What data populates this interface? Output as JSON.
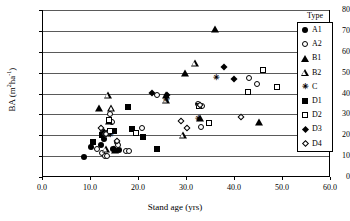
{
  "chart_data": {
    "type": "scatter",
    "title": "",
    "xlabel": "Stand age (yrs)",
    "ylabel_text": "BA (m",
    "ylabel_sup1": "2",
    "ylabel_mid": "ha",
    "ylabel_sup2": "-1",
    "ylabel_end": ")",
    "ylabel": "BA (m2ha-1)",
    "xlim": [
      0,
      60
    ],
    "ylim": [
      0,
      80
    ],
    "xticks": [
      "0.0",
      "10.0",
      "20.0",
      "30.0",
      "40.0",
      "50.0",
      "60.0"
    ],
    "xtick_values": [
      0,
      10,
      20,
      30,
      40,
      50,
      60
    ],
    "yticks": [
      "0",
      "10",
      "20",
      "30",
      "40",
      "50",
      "60",
      "70",
      "80"
    ],
    "ytick_values": [
      0,
      10,
      20,
      30,
      40,
      50,
      60,
      70,
      80
    ],
    "grid": "horizontal",
    "legend_position": "right-inside",
    "legend_title": "Type",
    "series": [
      {
        "name": "A1",
        "marker": "filled-circle",
        "points": [
          [
            8.7,
            9.8
          ],
          [
            10.3,
            14.2
          ],
          [
            12.2,
            15.4
          ],
          [
            13.0,
            18.4
          ],
          [
            13.5,
            21.2
          ],
          [
            14.3,
            22.0
          ],
          [
            14.8,
            13.6
          ],
          [
            15.6,
            16.6
          ],
          [
            16.0,
            13.1
          ]
        ]
      },
      {
        "name": "A2",
        "marker": "open-circle",
        "points": [
          [
            11.5,
            13.2
          ],
          [
            12.4,
            11.4
          ],
          [
            13.2,
            10.2
          ],
          [
            13.6,
            10.2
          ],
          [
            14.2,
            30.1
          ],
          [
            14.6,
            26.4
          ],
          [
            15.8,
            15.1
          ],
          [
            17.4,
            12.5
          ],
          [
            18.2,
            12.6
          ],
          [
            20.8,
            23.3
          ],
          [
            23.9,
            39.3
          ],
          [
            32.6,
            35.0
          ],
          [
            33.4,
            33.9
          ],
          [
            33.2,
            24.0
          ],
          [
            43.2,
            47.3
          ],
          [
            44.8,
            44.5
          ]
        ]
      },
      {
        "name": "B1",
        "marker": "filled-triangle",
        "points": [
          [
            11.9,
            32.9
          ],
          [
            13.6,
            21.2
          ],
          [
            14.0,
            26.9
          ],
          [
            15.3,
            13.1
          ],
          [
            25.9,
            39.3
          ],
          [
            29.7,
            49.6
          ],
          [
            33.0,
            28.4
          ],
          [
            36.1,
            70.7
          ],
          [
            45.2,
            26.2
          ]
        ]
      },
      {
        "name": "B2",
        "marker": "open-triangle",
        "points": [
          [
            13.3,
            13.4
          ],
          [
            13.7,
            39.2
          ],
          [
            14.4,
            33.0
          ],
          [
            25.8,
            37.1
          ],
          [
            29.3,
            20.1
          ],
          [
            31.8,
            54.8
          ]
        ]
      },
      {
        "name": "C",
        "marker": "asterisk",
        "points": [
          [
            14.2,
            20.8
          ],
          [
            25.9,
            37.3
          ],
          [
            32.5,
            28.5
          ],
          [
            36.3,
            48.1
          ]
        ]
      },
      {
        "name": "D1",
        "marker": "filled-square",
        "points": [
          [
            10.6,
            17.0
          ],
          [
            12.6,
            20.1
          ],
          [
            14.4,
            21.8
          ],
          [
            14.9,
            22.0
          ],
          [
            17.9,
            33.3
          ],
          [
            18.8,
            22.9
          ],
          [
            21.0,
            19.3
          ],
          [
            23.9,
            13.2
          ]
        ]
      },
      {
        "name": "D2",
        "marker": "open-square",
        "points": [
          [
            14.0,
            27.4
          ],
          [
            14.2,
            22.1
          ],
          [
            19.6,
            20.9
          ],
          [
            32.8,
            34.0
          ],
          [
            34.8,
            26.0
          ],
          [
            42.9,
            40.5
          ],
          [
            46.0,
            51.2
          ],
          [
            48.9,
            43.3
          ]
        ]
      },
      {
        "name": "D3",
        "marker": "filled-diamond",
        "points": [
          [
            12.7,
            21.9
          ],
          [
            15.1,
            13.4
          ],
          [
            22.9,
            40.3
          ],
          [
            26.0,
            39.5
          ],
          [
            37.9,
            52.5
          ],
          [
            40.0,
            46.9
          ]
        ]
      },
      {
        "name": "D4",
        "marker": "open-diamond",
        "points": [
          [
            12.2,
            23.5
          ],
          [
            13.3,
            20.4
          ],
          [
            15.6,
            17.1
          ],
          [
            28.9,
            27.0
          ],
          [
            30.2,
            23.6
          ],
          [
            32.9,
            34.4
          ],
          [
            41.5,
            28.9
          ]
        ]
      }
    ]
  }
}
